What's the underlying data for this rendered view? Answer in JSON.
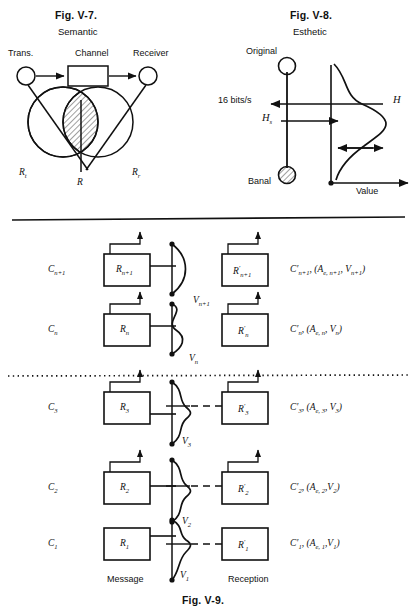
{
  "page": {
    "width": 417,
    "height": 614,
    "ink_color": "#111111",
    "background": "#ffffff"
  },
  "fig_v7": {
    "caption": "Fig. V-7.",
    "subtitle": "Semantic",
    "labels": {
      "transmitter": "Trans.",
      "channel": "Channel",
      "receiver": "Receiver",
      "r_t": "R",
      "r_t_sub": "t",
      "r_center": "R",
      "r_r": "R",
      "r_r_sub": "r"
    }
  },
  "fig_v8": {
    "caption": "Fig. V-8.",
    "subtitle": "Esthetic",
    "labels": {
      "original": "Original",
      "banal": "Banal",
      "bitrate": "16 bits/s",
      "h_s": "H",
      "h_s_sub": "s",
      "h_curve": "H",
      "value": "Value"
    }
  },
  "fig_v9": {
    "caption": "Fig. V-9.",
    "column_labels": {
      "message": "Message",
      "reception": "Reception"
    },
    "rows": [
      {
        "level": "C",
        "level_sub": "n+1",
        "box_left": "R",
        "box_left_sub": "n+1",
        "box_right": "R",
        "box_right_sub": "n+1",
        "box_right_prime": "′",
        "v_label": "V",
        "v_sub": "n+1",
        "right_label": "C′",
        "right_sub": "n+1",
        "right_rest": ", (A",
        "right_rest_sub": "e, n+1",
        "right_rest2": ", V",
        "right_rest2_sub": "n+1",
        "right_rest3": ")",
        "curve": "crescent",
        "link": "none"
      },
      {
        "level": "C",
        "level_sub": "n",
        "box_left": "R",
        "box_left_sub": "n",
        "box_right": "R",
        "box_right_sub": "n",
        "box_right_prime": "′",
        "v_label": "V",
        "v_sub": "n",
        "right_label": "C′",
        "right_sub": "n",
        "right_rest": ", (A",
        "right_rest_sub": "e, n",
        "right_rest2": ", V",
        "right_rest2_sub": "n",
        "right_rest3": ")",
        "curve": "s-curve",
        "link": "none"
      },
      {
        "level": "C",
        "level_sub": "3",
        "box_left": "R",
        "box_left_sub": "3",
        "box_right": "R",
        "box_right_sub": "3",
        "box_right_prime": "′",
        "v_label": "V",
        "v_sub": "3",
        "right_label": "C′",
        "right_sub": "3",
        "right_rest": ", (A",
        "right_rest_sub": "e, 3",
        "right_rest2": ", V",
        "right_rest2_sub": "3",
        "right_rest3": ")",
        "curve": "bell",
        "link": "dashed"
      },
      {
        "level": "C",
        "level_sub": "2",
        "box_left": "R",
        "box_left_sub": "2",
        "box_right": "R",
        "box_right_sub": "2",
        "box_right_prime": "′",
        "v_label": "V",
        "v_sub": "2",
        "right_label": "C′",
        "right_sub": "2",
        "right_rest": ", (A",
        "right_rest_sub": "e, 2",
        "right_rest2": ",V",
        "right_rest2_sub": "2",
        "right_rest3": ")",
        "curve": "bell",
        "link": "dashed"
      },
      {
        "level": "C",
        "level_sub": "1",
        "box_left": "R",
        "box_left_sub": "1",
        "box_right": "R",
        "box_right_sub": "1",
        "box_right_prime": "′",
        "v_label": "V",
        "v_sub": "1",
        "right_label": "C′",
        "right_sub": "1",
        "right_rest": ", (A",
        "right_rest_sub": "e, 1",
        "right_rest2": ",V",
        "right_rest2_sub": "1",
        "right_rest3": ")",
        "curve": "bell-narrow",
        "link": "dashed"
      }
    ],
    "separators": {
      "top_rule": "solid",
      "mid_rule": "dotted"
    }
  }
}
